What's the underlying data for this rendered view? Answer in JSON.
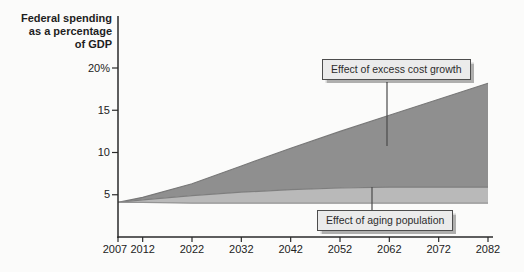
{
  "colors": {
    "excess_band": "#8f8f8f",
    "aging_band": "#b9b9b9",
    "total_line": "#787878",
    "aging_line": "#7e7e7e",
    "baseline_line": "#949494",
    "axis": "#2a2a2a",
    "leader_line": "#4a4a4a",
    "background": "#fbfbfa"
  },
  "chart_data": {
    "type": "area",
    "title": "Federal spending as a percentage of GDP",
    "title_lines": [
      "Federal spending",
      "as a percentage",
      "of GDP"
    ],
    "xlabel": "",
    "ylabel": "Federal spending as a percentage of GDP",
    "xlim": [
      2007,
      2082
    ],
    "ylim": [
      0,
      21
    ],
    "grid": false,
    "x": [
      2007,
      2012,
      2022,
      2032,
      2042,
      2052,
      2062,
      2072,
      2082
    ],
    "x_tick_labels": [
      "2007",
      "2012",
      "2022",
      "2032",
      "2042",
      "2052",
      "2062",
      "2072",
      "2082"
    ],
    "y_ticks": [
      {
        "value": 20,
        "label": "20%"
      },
      {
        "value": 15,
        "label": "15"
      },
      {
        "value": 10,
        "label": "10"
      },
      {
        "value": 5,
        "label": "5"
      }
    ],
    "series": [
      {
        "name": "Total spending (top of excess cost growth band)",
        "values": [
          4.1,
          4.7,
          6.3,
          8.4,
          10.5,
          12.5,
          14.4,
          16.3,
          18.2
        ]
      },
      {
        "name": "Spending with aging only (top of aging band)",
        "values": [
          4.1,
          4.4,
          4.9,
          5.3,
          5.6,
          5.8,
          5.9,
          5.9,
          5.9
        ]
      },
      {
        "name": "Baseline 2007 spending level (bottom of bands)",
        "values": [
          4.1,
          4.1,
          4.0,
          4.0,
          4.0,
          4.0,
          4.0,
          4.0,
          4.0
        ]
      }
    ],
    "bands": [
      {
        "name": "Effect of excess cost growth",
        "between": [
          "Total spending",
          "Spending with aging only"
        ]
      },
      {
        "name": "Effect of aging population",
        "between": [
          "Spending with aging only",
          "Baseline 2007 spending level"
        ]
      }
    ],
    "annotations": [
      {
        "text": "Effect of excess cost growth"
      },
      {
        "text": "Effect of aging population"
      }
    ]
  }
}
